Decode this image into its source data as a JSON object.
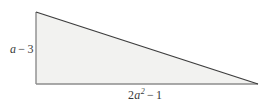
{
  "figure": {
    "name": "right-triangle-diagram",
    "shape": "right-triangle",
    "background_color": "#ffffff",
    "fill_color": "#f2f2f0",
    "hypotenuse_color": "#3d3d3d",
    "leg_color": "#8c8c8c",
    "vertices": {
      "top_left": [
        36,
        12
      ],
      "bottom_left": [
        36,
        84
      ],
      "bottom_right": [
        258,
        84
      ]
    }
  },
  "labels": {
    "height": {
      "full_text": "a − 3",
      "variable": "a",
      "operator": "−",
      "constant": "3",
      "position": "left-of-vertical-leg"
    },
    "base": {
      "full_text": "2a2 − 1",
      "coefficient": "2",
      "variable": "a",
      "exponent": "2",
      "operator": "−",
      "constant": "1",
      "position": "below-horizontal-leg"
    }
  }
}
